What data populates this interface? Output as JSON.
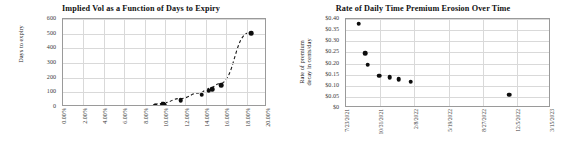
{
  "chart_data": [
    {
      "type": "scatter",
      "title": "Implied Vol as a Function of Days to Expiry",
      "xlabel": "",
      "ylabel": "Days to expiry",
      "xlim": [
        0,
        20
      ],
      "ylim": [
        0,
        600
      ],
      "grid": true,
      "legend": "none",
      "xticklabels": [
        "0.00%",
        "2.00%",
        "4.00%",
        "6.00%",
        "8.00%",
        "10.00%",
        "12.00%",
        "14.00%",
        "16.00%",
        "18.00%",
        "20.00%"
      ],
      "xtickvalues": [
        0,
        2,
        4,
        6,
        8,
        10,
        12,
        14,
        16,
        18,
        20
      ],
      "yticklabels": [
        "0",
        "100",
        "200",
        "300",
        "400",
        "500",
        "600"
      ],
      "ytickvalues": [
        0,
        100,
        200,
        300,
        400,
        500,
        600
      ],
      "points": [
        {
          "x": 9.05,
          "y": 7
        },
        {
          "x": 9.75,
          "y": 10
        },
        {
          "x": 9.85,
          "y": 22
        },
        {
          "x": 9.95,
          "y": 16
        },
        {
          "x": 11.55,
          "y": 45
        },
        {
          "x": 13.6,
          "y": 85
        },
        {
          "x": 14.3,
          "y": 112
        },
        {
          "x": 14.6,
          "y": 122
        },
        {
          "x": 15.5,
          "y": 148
        },
        {
          "x": 18.45,
          "y": 505
        }
      ],
      "trendline": {
        "style": "dashed",
        "color": "#1a1a1a"
      },
      "marker_color": "#0d0d0d"
    },
    {
      "type": "scatter",
      "title": "Rate of Daily Time Premium Erosion Over Time",
      "xlabel": "",
      "ylabel": "Rate of premium decay in cents/day",
      "ylabel_line1": "Rate of premium",
      "ylabel_line2": "decay in cents/day",
      "ylim": [
        0,
        0.4
      ],
      "grid": true,
      "legend": "none",
      "xticklabels": [
        "7/23/2021",
        "10/31/2021",
        "2/8/2022",
        "5/19/2022",
        "8/27/2022",
        "12/5/2022",
        "3/15/2023"
      ],
      "yticklabels": [
        "$0",
        "$0.05",
        "$0.10",
        "$0.15",
        "$0.20",
        "$0.25",
        "$0.30",
        "$0.35",
        "$0.40"
      ],
      "ytickvalues": [
        0,
        0.05,
        0.1,
        0.15,
        0.2,
        0.25,
        0.3,
        0.35,
        0.4
      ],
      "points": [
        {
          "xfrac": 0.062,
          "y": 0.378
        },
        {
          "xfrac": 0.093,
          "y": 0.247
        },
        {
          "xfrac": 0.105,
          "y": 0.195
        },
        {
          "xfrac": 0.163,
          "y": 0.145
        },
        {
          "xfrac": 0.213,
          "y": 0.139
        },
        {
          "xfrac": 0.258,
          "y": 0.129
        },
        {
          "xfrac": 0.315,
          "y": 0.119
        },
        {
          "xfrac": 0.797,
          "y": 0.06
        }
      ],
      "marker_color": "#0d0d0d"
    }
  ]
}
